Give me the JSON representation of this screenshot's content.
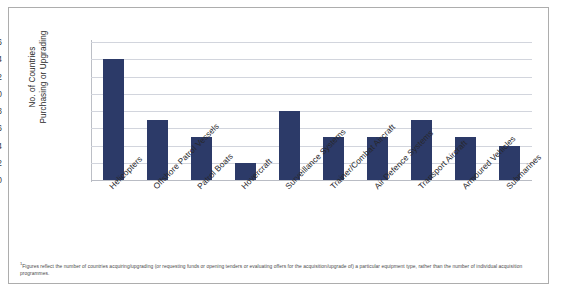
{
  "chart_data": {
    "type": "bar",
    "title": "",
    "xlabel": "",
    "ylabel": "No. of Countries Purchasing or Upgrading",
    "ylabel_line1": "No. of Countries",
    "ylabel_line2": "Purchasing or Upgrading",
    "ylim": [
      0,
      16
    ],
    "ytick_step": 2,
    "yticks": [
      16,
      14,
      12,
      10,
      8,
      6,
      4,
      2,
      0
    ],
    "grid": true,
    "legend": "none",
    "bar_color": "#2c3a68",
    "gridline_color": "#d2d5dd",
    "categories": [
      "Helicopters",
      "Offshore Patrol Vessels",
      "Patrol Boats",
      "Hovercraft",
      "Surveillance Systems",
      "Trainer/Combat Aircraft",
      "Air Defence Systems",
      "Transport Aircraft",
      "Armoured Vehicles",
      "Submarines"
    ],
    "values": [
      14,
      7,
      5,
      2,
      8,
      5,
      5,
      7,
      5,
      4
    ]
  },
  "footnote": {
    "marker": "1",
    "text": "Figures reflect the number of countries acquiring/upgrading (or requesting funds or opening tenders or evaluating offers for the acquisition/upgrade of) a particular equipment type, rather than the number of individual acquisition programmes."
  }
}
